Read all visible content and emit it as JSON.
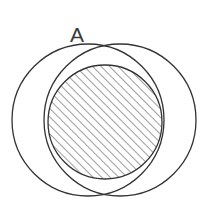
{
  "figure": {
    "background_color": "#ffffff",
    "stroke_color": "#333333",
    "hatch_color": "#555555",
    "label_color": "#3a3a3a",
    "width": 213,
    "height": 220
  },
  "labels": {
    "point_a": "A"
  },
  "chart_data": {
    "type": "diagram",
    "shapes": [
      {
        "name": "left-circle",
        "kind": "circle",
        "center_x": 88,
        "center_y": 120,
        "radius": 76,
        "filled": false,
        "stroke": "#333333",
        "stroke_width": 1.3
      },
      {
        "name": "right-circle",
        "kind": "circle",
        "center_x": 120,
        "center_y": 120,
        "radius": 76,
        "filled": false,
        "stroke": "#333333",
        "stroke_width": 1.3
      },
      {
        "name": "hatched-circle",
        "kind": "circle",
        "center_x": 105,
        "center_y": 122,
        "radius": 57,
        "filled": true,
        "fill_pattern": "diagonal-hatch-45",
        "hatch_spacing": 6,
        "hatch_angle_deg": 45,
        "stroke": "#333333",
        "stroke_width": 1.3
      }
    ],
    "points": [
      {
        "name": "A",
        "label": "A",
        "x": 85,
        "y": 53,
        "description": "upper intersection of the two circles"
      },
      {
        "name": "B",
        "label": "",
        "x": 123,
        "y": 192,
        "description": "lower intersection of the two circles"
      }
    ],
    "annotations": [
      {
        "name": "label-a",
        "text": "A",
        "x": 77,
        "y": 42,
        "anchor": "middle",
        "font_size": 21
      }
    ],
    "grid": false,
    "legend": false,
    "axes": false
  }
}
